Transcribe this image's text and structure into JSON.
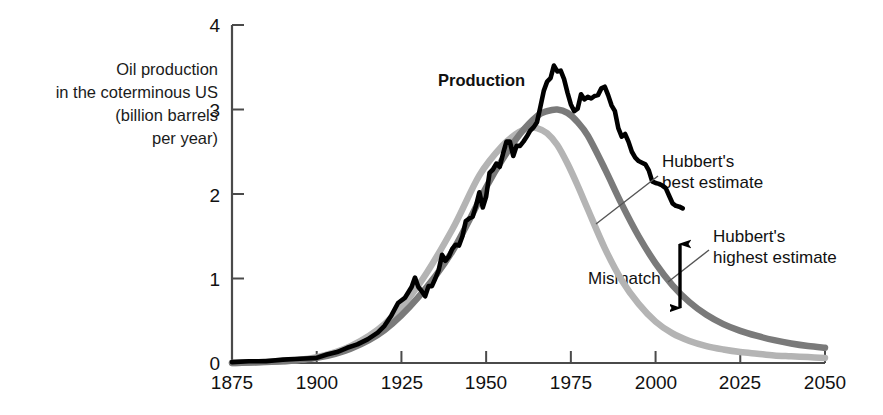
{
  "chart_data": {
    "type": "line",
    "title": "",
    "xlabel": "",
    "ylabel": "Oil production in the coterminous US (billion barrels per year)",
    "xlim": [
      1875,
      2050
    ],
    "ylim": [
      0,
      4
    ],
    "xticks": [
      "1875",
      "1900",
      "1925",
      "1950",
      "1975",
      "2000",
      "2025",
      "2050"
    ],
    "xtick_values": [
      1875,
      1900,
      1925,
      1950,
      1975,
      2000,
      2025,
      2050
    ],
    "yticks": [
      "0",
      "1",
      "2",
      "3",
      "4"
    ],
    "ytick_values": [
      0,
      1,
      2,
      3,
      4
    ],
    "grid": false,
    "legend_position": "inline-annotations",
    "series": [
      {
        "name": "Production",
        "color": "#000000",
        "x": [
          1875,
          1880,
          1885,
          1890,
          1895,
          1900,
          1903,
          1906,
          1909,
          1912,
          1915,
          1918,
          1920,
          1922,
          1924,
          1926,
          1928,
          1929,
          1930,
          1931,
          1932,
          1933,
          1934,
          1935,
          1936,
          1937,
          1938,
          1939,
          1940,
          1941,
          1942,
          1943,
          1944,
          1945,
          1946,
          1947,
          1948,
          1949,
          1950,
          1951,
          1952,
          1953,
          1954,
          1955,
          1956,
          1957,
          1958,
          1959,
          1960,
          1961,
          1962,
          1963,
          1964,
          1965,
          1966,
          1967,
          1968,
          1969,
          1970,
          1971,
          1972,
          1973,
          1974,
          1975,
          1976,
          1977,
          1978,
          1979,
          1980,
          1981,
          1982,
          1983,
          1984,
          1985,
          1986,
          1987,
          1988,
          1989,
          1990,
          1991,
          1992,
          1993,
          1994,
          1995,
          1996,
          1997,
          1998,
          1999,
          2000,
          2001,
          2002,
          2003,
          2004,
          2005,
          2006,
          2007,
          2008
        ],
        "values": [
          0.01,
          0.02,
          0.02,
          0.04,
          0.05,
          0.06,
          0.1,
          0.13,
          0.18,
          0.22,
          0.28,
          0.36,
          0.44,
          0.56,
          0.71,
          0.77,
          0.9,
          1.01,
          0.9,
          0.85,
          0.79,
          0.91,
          0.91,
          1.0,
          1.1,
          1.28,
          1.21,
          1.26,
          1.35,
          1.4,
          1.39,
          1.5,
          1.68,
          1.71,
          1.73,
          1.86,
          2.02,
          1.84,
          1.97,
          2.25,
          2.29,
          2.36,
          2.32,
          2.48,
          2.62,
          2.62,
          2.45,
          2.57,
          2.57,
          2.62,
          2.68,
          2.75,
          2.79,
          2.85,
          3.03,
          3.22,
          3.33,
          3.37,
          3.52,
          3.45,
          3.46,
          3.36,
          3.2,
          3.06,
          2.98,
          3.01,
          3.18,
          3.12,
          3.15,
          3.13,
          3.16,
          3.17,
          3.25,
          3.27,
          3.17,
          3.05,
          2.98,
          2.78,
          2.68,
          2.71,
          2.62,
          2.5,
          2.43,
          2.39,
          2.37,
          2.35,
          2.28,
          2.15,
          2.13,
          2.12,
          2.1,
          2.07,
          1.98,
          1.89,
          1.86,
          1.85,
          1.83
        ],
        "note": "Actual US oil production, jagged trace"
      },
      {
        "name": "Hubbert's highest estimate",
        "color": "#7a7a7a",
        "peak_year": 1971,
        "peak_value": 3.0,
        "x": [
          1875,
          1890,
          1900,
          1910,
          1920,
          1930,
          1940,
          1950,
          1955,
          1960,
          1965,
          1968,
          1971,
          1974,
          1977,
          1980,
          1985,
          1990,
          1995,
          2000,
          2005,
          2010,
          2015,
          2020,
          2025,
          2030,
          2035,
          2040,
          2045,
          2050
        ],
        "values": [
          0.0,
          0.02,
          0.06,
          0.17,
          0.39,
          0.78,
          1.32,
          2.08,
          2.42,
          2.71,
          2.92,
          2.98,
          3.0,
          2.96,
          2.85,
          2.69,
          2.3,
          1.88,
          1.5,
          1.18,
          0.92,
          0.72,
          0.57,
          0.46,
          0.38,
          0.32,
          0.27,
          0.23,
          0.2,
          0.18
        ]
      },
      {
        "name": "Hubbert's best estimate",
        "color": "#b4b4b4",
        "peak_year": 1965,
        "peak_value": 2.78,
        "x": [
          1875,
          1890,
          1900,
          1910,
          1920,
          1930,
          1940,
          1948,
          1955,
          1960,
          1963,
          1965,
          1968,
          1971,
          1974,
          1977,
          1980,
          1985,
          1990,
          1995,
          2000,
          2005,
          2010,
          2015,
          2020,
          2025,
          2030,
          2035,
          2040,
          2045,
          2050
        ],
        "values": [
          0.0,
          0.02,
          0.07,
          0.2,
          0.46,
          0.92,
          1.58,
          2.22,
          2.58,
          2.74,
          2.78,
          2.78,
          2.72,
          2.58,
          2.36,
          2.1,
          1.82,
          1.36,
          0.98,
          0.7,
          0.49,
          0.35,
          0.26,
          0.2,
          0.16,
          0.13,
          0.11,
          0.09,
          0.08,
          0.07,
          0.06
        ]
      }
    ],
    "annotations": [
      {
        "name": "production-label",
        "text": "Production",
        "bold": true,
        "x": 438,
        "y": 70
      },
      {
        "name": "hubberts-best-estimate-label",
        "text": "Hubbert's\nbest estimate",
        "x": 662,
        "y": 151
      },
      {
        "name": "hubberts-highest-estimate-label",
        "text": "Hubbert's\nhighest estimate",
        "x": 713,
        "y": 226
      },
      {
        "name": "mismatch-label",
        "text": "Mismatch",
        "x": 588,
        "y": 269
      }
    ]
  },
  "axis_title_lines": [
    "Oil production",
    "in the coterminous US",
    "(billion barrels",
    "per year)"
  ],
  "axis_title_text": "Oil production\nin the coterminous US\n(billion barrels\nper year)",
  "annotations": {
    "production": "Production",
    "best_estimate": "Hubbert's\nbest estimate",
    "highest_estimate": "Hubbert's\nhighest estimate",
    "mismatch": "Mismatch"
  },
  "colors": {
    "production": "#000000",
    "highest_estimate": "#7a7a7a",
    "best_estimate": "#b4b4b4",
    "axis": "#4a4a4a",
    "text": "#111111"
  }
}
